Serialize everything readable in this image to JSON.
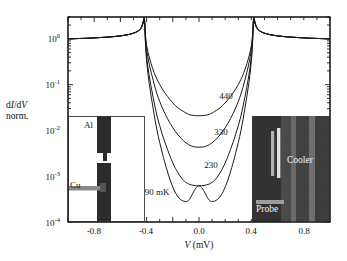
{
  "figure": {
    "kind": "semilog-plot-with-insets",
    "background": "#ffffff",
    "frame_color": "#1a1a1a",
    "curve_color": "#1a1a1a"
  },
  "chart_data": {
    "type": "line",
    "title": "",
    "xlabel": "V (mV)",
    "ylabel": "dI/dV norm.",
    "xlabel_parts": {
      "symbol": "V",
      "unit": "(mV)"
    },
    "ylabel_line1": "dI/dV",
    "ylabel_line2": "norm.",
    "yscale": "log",
    "xscale": "linear",
    "xlim": [
      -1.0,
      1.0
    ],
    "ylim": [
      0.0001,
      3.0
    ],
    "grid": false,
    "legend": "inline-annotations",
    "xticks": [
      -0.8,
      -0.4,
      0.0,
      0.4,
      0.8
    ],
    "xticklabels": [
      "-0.8",
      "-0.4",
      "0.0",
      "0.4",
      "0.8"
    ],
    "yticks": [
      1,
      0.1,
      0.01,
      0.001,
      0.0001
    ],
    "yticklabels": [
      "10",
      "10",
      "10",
      "10",
      "10"
    ],
    "ytick_exponents": [
      "0",
      "-1",
      "-2",
      "-3",
      "-4"
    ],
    "gap_voltage_mV": 0.42,
    "annotations": [
      {
        "text": "440",
        "x": 0.215,
        "y": 0.13,
        "series": "440 mK"
      },
      {
        "text": "330",
        "x": 0.175,
        "y": 0.022,
        "series": "330 mK"
      },
      {
        "text": "230",
        "x": 0.115,
        "y": 0.0042,
        "series": "230 mK"
      },
      {
        "text": "90 mK",
        "x": -0.215,
        "y": 0.00075,
        "series": "90 mK"
      }
    ],
    "series": [
      {
        "name": "440 mK",
        "temperature_mK": 440,
        "label": "440",
        "minimum_value": 0.021,
        "x": [
          -1.0,
          -0.95,
          -0.9,
          -0.85,
          -0.8,
          -0.75,
          -0.7,
          -0.65,
          -0.6,
          -0.55,
          -0.5,
          -0.47,
          -0.45,
          -0.435,
          -0.425,
          -0.42,
          -0.415,
          -0.41,
          -0.4,
          -0.38,
          -0.35,
          -0.32,
          -0.28,
          -0.24,
          -0.2,
          -0.16,
          -0.12,
          -0.08,
          -0.04,
          0.0,
          0.04,
          0.08,
          0.12,
          0.16,
          0.2,
          0.24,
          0.28,
          0.32,
          0.35,
          0.38,
          0.4,
          0.41,
          0.415,
          0.42,
          0.425,
          0.435,
          0.45,
          0.47,
          0.5,
          0.55,
          0.6,
          0.65,
          0.7,
          0.75,
          0.8,
          0.85,
          0.9,
          0.95,
          1.0
        ],
        "y": [
          1.0,
          1.01,
          1.02,
          1.03,
          1.05,
          1.07,
          1.09,
          1.12,
          1.16,
          1.22,
          1.33,
          1.45,
          1.6,
          1.85,
          2.25,
          2.55,
          2.3,
          1.35,
          0.72,
          0.4,
          0.21,
          0.13,
          0.08,
          0.055,
          0.04,
          0.031,
          0.026,
          0.0225,
          0.0212,
          0.021,
          0.0212,
          0.0225,
          0.026,
          0.031,
          0.04,
          0.055,
          0.08,
          0.13,
          0.21,
          0.4,
          0.72,
          1.35,
          2.3,
          2.55,
          2.25,
          1.85,
          1.6,
          1.45,
          1.33,
          1.22,
          1.16,
          1.12,
          1.09,
          1.07,
          1.05,
          1.03,
          1.02,
          1.01,
          1.0
        ]
      },
      {
        "name": "330 mK",
        "temperature_mK": 330,
        "label": "330",
        "minimum_value": 0.0043,
        "x": [
          -1.0,
          -0.95,
          -0.9,
          -0.85,
          -0.8,
          -0.75,
          -0.7,
          -0.65,
          -0.6,
          -0.55,
          -0.5,
          -0.47,
          -0.45,
          -0.435,
          -0.425,
          -0.42,
          -0.415,
          -0.41,
          -0.4,
          -0.38,
          -0.35,
          -0.32,
          -0.28,
          -0.24,
          -0.2,
          -0.16,
          -0.12,
          -0.08,
          -0.04,
          0.0,
          0.04,
          0.08,
          0.12,
          0.16,
          0.2,
          0.24,
          0.28,
          0.32,
          0.35,
          0.38,
          0.4,
          0.41,
          0.415,
          0.42,
          0.425,
          0.435,
          0.45,
          0.47,
          0.5,
          0.55,
          0.6,
          0.65,
          0.7,
          0.75,
          0.8,
          0.85,
          0.9,
          0.95,
          1.0
        ],
        "y": [
          1.0,
          1.01,
          1.02,
          1.03,
          1.05,
          1.07,
          1.09,
          1.12,
          1.16,
          1.22,
          1.33,
          1.45,
          1.6,
          1.88,
          2.35,
          2.7,
          2.4,
          1.25,
          0.6,
          0.28,
          0.125,
          0.062,
          0.031,
          0.018,
          0.0115,
          0.008,
          0.006,
          0.0049,
          0.0044,
          0.0043,
          0.0044,
          0.0049,
          0.006,
          0.008,
          0.0115,
          0.018,
          0.031,
          0.062,
          0.125,
          0.28,
          0.6,
          1.25,
          2.4,
          2.7,
          2.35,
          1.88,
          1.6,
          1.45,
          1.33,
          1.22,
          1.16,
          1.12,
          1.09,
          1.07,
          1.05,
          1.03,
          1.02,
          1.01,
          1.0
        ]
      },
      {
        "name": "230 mK",
        "temperature_mK": 230,
        "label": "230",
        "minimum_value": 0.00062,
        "x": [
          -1.0,
          -0.95,
          -0.9,
          -0.85,
          -0.8,
          -0.75,
          -0.7,
          -0.65,
          -0.6,
          -0.55,
          -0.5,
          -0.47,
          -0.45,
          -0.435,
          -0.425,
          -0.42,
          -0.415,
          -0.41,
          -0.4,
          -0.38,
          -0.35,
          -0.32,
          -0.28,
          -0.24,
          -0.2,
          -0.16,
          -0.12,
          -0.08,
          -0.04,
          0.0,
          0.04,
          0.08,
          0.12,
          0.16,
          0.2,
          0.24,
          0.28,
          0.32,
          0.35,
          0.38,
          0.4,
          0.41,
          0.415,
          0.42,
          0.425,
          0.435,
          0.45,
          0.47,
          0.5,
          0.55,
          0.6,
          0.65,
          0.7,
          0.75,
          0.8,
          0.85,
          0.9,
          0.95,
          1.0
        ],
        "y": [
          1.0,
          1.01,
          1.02,
          1.03,
          1.05,
          1.07,
          1.09,
          1.12,
          1.16,
          1.22,
          1.33,
          1.45,
          1.62,
          1.92,
          2.45,
          2.85,
          2.45,
          1.05,
          0.42,
          0.155,
          0.053,
          0.0205,
          0.0082,
          0.0038,
          0.00195,
          0.00118,
          0.00082,
          0.00068,
          0.00063,
          0.00062,
          0.00063,
          0.00068,
          0.00082,
          0.00118,
          0.00195,
          0.0038,
          0.0082,
          0.0205,
          0.053,
          0.155,
          0.42,
          1.05,
          2.45,
          2.85,
          2.45,
          1.92,
          1.62,
          1.45,
          1.33,
          1.22,
          1.16,
          1.12,
          1.09,
          1.07,
          1.05,
          1.03,
          1.02,
          1.01,
          1.0
        ]
      },
      {
        "name": "90 mK",
        "temperature_mK": 90,
        "label": "90 mK",
        "shape": "double-minimum",
        "minimum_value": 0.00028,
        "zero_bias_peak_value": 0.00062,
        "minima_positions_mV": [
          -0.095,
          0.095
        ],
        "x": [
          -1.0,
          -0.95,
          -0.9,
          -0.85,
          -0.8,
          -0.75,
          -0.7,
          -0.65,
          -0.6,
          -0.55,
          -0.5,
          -0.47,
          -0.45,
          -0.435,
          -0.425,
          -0.42,
          -0.415,
          -0.41,
          -0.4,
          -0.38,
          -0.35,
          -0.32,
          -0.28,
          -0.25,
          -0.22,
          -0.19,
          -0.165,
          -0.14,
          -0.12,
          -0.11,
          -0.1,
          -0.095,
          -0.09,
          -0.08,
          -0.065,
          -0.05,
          -0.035,
          -0.02,
          -0.01,
          0.0,
          0.01,
          0.02,
          0.035,
          0.05,
          0.065,
          0.08,
          0.09,
          0.095,
          0.1,
          0.11,
          0.12,
          0.14,
          0.165,
          0.19,
          0.22,
          0.25,
          0.28,
          0.32,
          0.35,
          0.38,
          0.4,
          0.41,
          0.415,
          0.42,
          0.425,
          0.435,
          0.45,
          0.47,
          0.5,
          0.55,
          0.6,
          0.65,
          0.7,
          0.75,
          0.8,
          0.85,
          0.9,
          0.95,
          1.0
        ],
        "y": [
          1.0,
          1.01,
          1.02,
          1.03,
          1.05,
          1.07,
          1.09,
          1.12,
          1.16,
          1.22,
          1.33,
          1.45,
          1.62,
          1.95,
          2.5,
          2.95,
          2.5,
          0.95,
          0.33,
          0.105,
          0.03,
          0.0098,
          0.0032,
          0.00155,
          0.00082,
          0.0005,
          0.00037,
          0.00031,
          0.000288,
          0.000282,
          0.00028,
          0.00028,
          0.000282,
          0.000295,
          0.00034,
          0.00041,
          0.00049,
          0.000565,
          0.0006,
          0.00062,
          0.0006,
          0.000565,
          0.00049,
          0.00041,
          0.00034,
          0.000295,
          0.000282,
          0.00028,
          0.00028,
          0.000282,
          0.000288,
          0.00031,
          0.00037,
          0.0005,
          0.00082,
          0.00155,
          0.0032,
          0.0098,
          0.03,
          0.105,
          0.33,
          0.95,
          2.5,
          2.95,
          2.5,
          1.95,
          1.62,
          1.45,
          1.33,
          1.22,
          1.16,
          1.12,
          1.09,
          1.07,
          1.05,
          1.03,
          1.02,
          1.01,
          1.0
        ]
      }
    ]
  },
  "inset_left": {
    "name": "sample-schematic",
    "labels": [
      {
        "text": "Al",
        "role": "aluminum-electrode"
      },
      {
        "text": "Cu",
        "role": "copper-electrode"
      }
    ],
    "background": "#ffffff",
    "structure_color": "#2a2a2a"
  },
  "inset_right": {
    "name": "sem-micrograph",
    "labels": [
      {
        "text": "Cooler",
        "role": "cooler-electrode"
      },
      {
        "text": "Probe",
        "role": "probe-electrode"
      }
    ],
    "background": "#3a3a3a"
  }
}
